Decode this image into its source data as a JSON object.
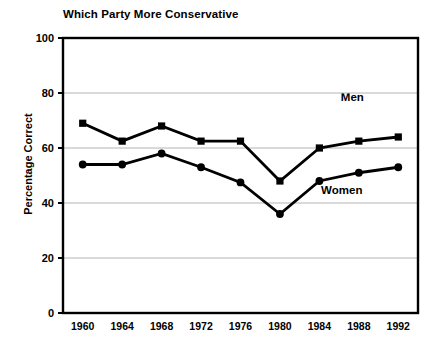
{
  "chart_data": {
    "type": "line",
    "title": "Which Party More Conservative",
    "xlabel": "",
    "ylabel": "Percentage Correct",
    "categories": [
      "1960",
      "1964",
      "1968",
      "1972",
      "1976",
      "1980",
      "1984",
      "1988",
      "1992"
    ],
    "x": [
      1960,
      1964,
      1968,
      1972,
      1976,
      1980,
      1984,
      1988,
      1992
    ],
    "ylim": [
      0,
      100
    ],
    "yticks": [
      0,
      20,
      40,
      60,
      80,
      100
    ],
    "ytick_labels": [
      "0",
      "20",
      "40",
      "60",
      "80",
      "100"
    ],
    "grid": true,
    "grid_axis": "y",
    "legend": "inline-annotations",
    "series": [
      {
        "name": "Men",
        "marker": "square",
        "color": "#000000",
        "values": [
          69,
          62.5,
          68,
          62.5,
          62.5,
          48,
          60,
          62.5,
          64
        ]
      },
      {
        "name": "Women",
        "marker": "circle",
        "color": "#000000",
        "values": [
          54,
          54,
          58,
          53,
          47.5,
          36,
          48,
          51,
          53
        ]
      }
    ],
    "annotations": [
      {
        "text": "Men",
        "x": 1988,
        "y": 78
      },
      {
        "text": "Women",
        "x": 1986,
        "y": 44
      }
    ]
  },
  "colors": {
    "line": "#000000",
    "axis": "#000000",
    "grid": "#b4b4b4",
    "background": "#ffffff"
  }
}
